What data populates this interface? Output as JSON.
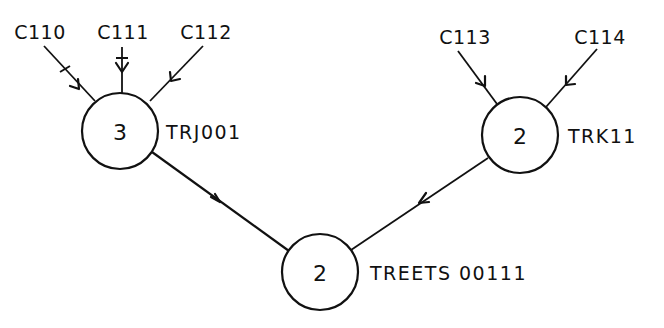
{
  "diagram": {
    "type": "directed-tree",
    "nodes": [
      {
        "id": "TRJ001",
        "count": "3",
        "label": "TRJ001"
      },
      {
        "id": "TRK11",
        "count": "2",
        "label": "TRK11"
      },
      {
        "id": "TREETS00111",
        "count": "2",
        "label": "TREETS 00111"
      }
    ],
    "inputs": [
      {
        "label": "C110",
        "target": "TRJ001",
        "has_tick": true
      },
      {
        "label": "C111",
        "target": "TRJ001",
        "has_tick": true
      },
      {
        "label": "C112",
        "target": "TRJ001",
        "has_tick": false
      },
      {
        "label": "C113",
        "target": "TRK11",
        "has_tick": false
      },
      {
        "label": "C114",
        "target": "TRK11",
        "has_tick": false
      }
    ],
    "edges": [
      {
        "from": "TRJ001",
        "to": "TREETS00111"
      },
      {
        "from": "TRK11",
        "to": "TREETS00111"
      }
    ],
    "colors": {
      "stroke": "#111111",
      "background": "#ffffff"
    }
  }
}
